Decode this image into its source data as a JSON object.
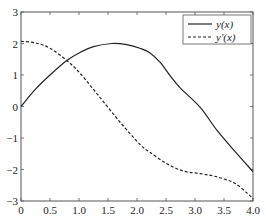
{
  "chart_data": {
    "type": "line",
    "title": "",
    "xlabel": "",
    "ylabel": "",
    "xlim": [
      0,
      4
    ],
    "ylim": [
      -3,
      3
    ],
    "grid": false,
    "legend_position": "upper right",
    "x_ticks": [
      "0",
      "0.5",
      "1.0",
      "1.5",
      "2.0",
      "2.5",
      "3.0",
      "3.5",
      "4.0"
    ],
    "y_ticks": [
      "-3",
      "-2",
      "-1",
      "0",
      "1",
      "2",
      "3"
    ],
    "series": [
      {
        "name": "y(x)",
        "style": "solid",
        "color": "#222222",
        "x": [
          0,
          0.25,
          0.5,
          0.79,
          1.0,
          1.25,
          1.57,
          1.8,
          2.05,
          2.22,
          2.4,
          2.57,
          2.74,
          3.09,
          3.38,
          3.7,
          4.0
        ],
        "y": [
          0,
          0.55,
          1.0,
          1.46,
          1.7,
          1.9,
          2.0,
          1.97,
          1.85,
          1.71,
          1.4,
          0.98,
          0.6,
          -0.03,
          -0.76,
          -1.45,
          -2.07
        ]
      },
      {
        "name": "y'(x)",
        "style": "dashed",
        "color": "#222222",
        "x": [
          0,
          0.25,
          0.5,
          0.79,
          1.02,
          1.36,
          1.71,
          2.05,
          2.22,
          2.5,
          2.8,
          3.09,
          3.3,
          3.5,
          3.7,
          3.9,
          4.0
        ],
        "y": [
          2.07,
          2.02,
          1.85,
          1.46,
          1.05,
          0.29,
          -0.5,
          -1.2,
          -1.45,
          -1.8,
          -2.05,
          -2.13,
          -2.2,
          -2.3,
          -2.45,
          -2.75,
          -2.93
        ]
      }
    ]
  },
  "legend": {
    "items": [
      {
        "label": "y(x)",
        "style": "solid"
      },
      {
        "label": "y'(x)",
        "style": "dashed"
      }
    ]
  }
}
